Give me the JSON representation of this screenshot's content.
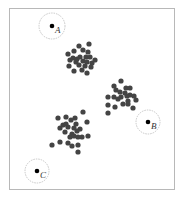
{
  "diagram": {
    "frame": {
      "x": 9,
      "y": 8,
      "w": 166,
      "h": 182,
      "stroke": "#b8b8b8"
    },
    "dot_color": "#444444",
    "dot_radius": 2.6,
    "centroid_color": "#000000",
    "ring_color": "#c8c8c8",
    "centroids": [
      {
        "label": "A",
        "x": 52,
        "y": 26,
        "ring_r": 13
      },
      {
        "label": "B",
        "x": 148,
        "y": 122,
        "ring_r": 12
      },
      {
        "label": "C",
        "x": 37,
        "y": 171,
        "ring_r": 12
      }
    ],
    "clusters": [
      {
        "name": "cluster-top",
        "points": [
          [
            79,
            46
          ],
          [
            89,
            44
          ],
          [
            74,
            51
          ],
          [
            83,
            50
          ],
          [
            88,
            52
          ],
          [
            68,
            54
          ],
          [
            80,
            57
          ],
          [
            86,
            57
          ],
          [
            90,
            57
          ],
          [
            95,
            60
          ],
          [
            70,
            60
          ],
          [
            76,
            62
          ],
          [
            83,
            61
          ],
          [
            87,
            62
          ],
          [
            92,
            63
          ],
          [
            69,
            66
          ],
          [
            79,
            65
          ],
          [
            85,
            66
          ],
          [
            91,
            67
          ],
          [
            74,
            71
          ],
          [
            82,
            70
          ],
          [
            87,
            73
          ],
          [
            73,
            58
          ],
          [
            77,
            59
          ]
        ]
      },
      {
        "name": "cluster-right",
        "points": [
          [
            121,
            81
          ],
          [
            114,
            86
          ],
          [
            126,
            88
          ],
          [
            130,
            88
          ],
          [
            116,
            90
          ],
          [
            120,
            92
          ],
          [
            125,
            93
          ],
          [
            130,
            95
          ],
          [
            108,
            97
          ],
          [
            114,
            97
          ],
          [
            121,
            97
          ],
          [
            127,
            96
          ],
          [
            134,
            96
          ],
          [
            118,
            99
          ],
          [
            128,
            101
          ],
          [
            136,
            100
          ],
          [
            108,
            105
          ],
          [
            115,
            107
          ],
          [
            123,
            104
          ],
          [
            128,
            104
          ],
          [
            133,
            108
          ],
          [
            108,
            113
          ]
        ]
      },
      {
        "name": "cluster-bottom-left",
        "points": [
          [
            83,
            112
          ],
          [
            58,
            118
          ],
          [
            66,
            117
          ],
          [
            71,
            120
          ],
          [
            75,
            118
          ],
          [
            87,
            122
          ],
          [
            63,
            125
          ],
          [
            60,
            128
          ],
          [
            68,
            127
          ],
          [
            74,
            128
          ],
          [
            80,
            129
          ],
          [
            65,
            132
          ],
          [
            72,
            134
          ],
          [
            77,
            131
          ],
          [
            70,
            137
          ],
          [
            74,
            136
          ],
          [
            78,
            137
          ],
          [
            82,
            137
          ],
          [
            88,
            136
          ],
          [
            60,
            142
          ],
          [
            68,
            143
          ],
          [
            72,
            146
          ],
          [
            78,
            145
          ],
          [
            52,
            145
          ],
          [
            78,
            152
          ],
          [
            66,
            124
          ],
          [
            76,
            124
          ]
        ]
      }
    ]
  }
}
